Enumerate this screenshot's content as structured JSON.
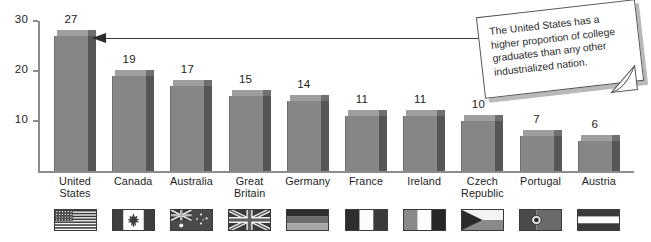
{
  "chart_data": {
    "type": "bar",
    "title": "",
    "xlabel": "",
    "ylabel": "",
    "ylim": [
      0,
      30
    ],
    "yticks": [
      10,
      20,
      30
    ],
    "grid": false,
    "legend": "none",
    "categories": [
      "United States",
      "Canada",
      "Australia",
      "Great Britain",
      "Germany",
      "France",
      "Ireland",
      "Czech Republic",
      "Portugal",
      "Austria"
    ],
    "category_lines": [
      [
        "United",
        "States"
      ],
      [
        "Canada"
      ],
      [
        "Australia"
      ],
      [
        "Great",
        "Britain"
      ],
      [
        "Germany"
      ],
      [
        "France"
      ],
      [
        "Ireland"
      ],
      [
        "Czech",
        "Republic"
      ],
      [
        "Portugal"
      ],
      [
        "Austria"
      ]
    ],
    "values": [
      27,
      19,
      17,
      15,
      14,
      11,
      11,
      10,
      7,
      6
    ],
    "value_labels": [
      "27",
      "19",
      "17",
      "15",
      "14",
      "11",
      "11",
      "10",
      "7",
      "6"
    ],
    "flags": [
      "flag-united-states",
      "flag-canada",
      "flag-australia",
      "flag-great-britain",
      "flag-germany",
      "flag-france",
      "flag-ireland",
      "flag-czech-republic",
      "flag-portugal",
      "flag-austria"
    ]
  },
  "annotation": {
    "text": "The United States has a higher proportion of college graduates than any other industrialized nation.",
    "pointer": "arrow-left",
    "target_category": "United States"
  },
  "colors": {
    "bar_face": "#868686",
    "bar_side": "#565656",
    "bar_top": "#9e9e9e",
    "axis": "#8c8c8c",
    "text": "#1d1d1d",
    "callout_bg": "#ffffff",
    "callout_shadow": "#b9b9b9",
    "connector": "#3a3a3a"
  }
}
